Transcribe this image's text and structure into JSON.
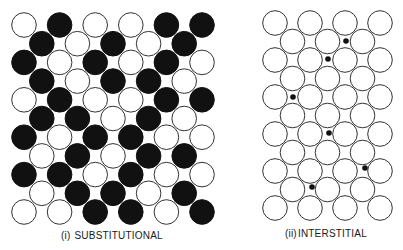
{
  "figure": {
    "colors": {
      "background": "#ffffff",
      "host_atom_fill": "#ffffff",
      "solute_atom_fill": "#111111",
      "outline": "#333333",
      "interstitial_fill": "#111111"
    },
    "panels": [
      {
        "id": "substitutional",
        "numeral": "(i)",
        "caption": "SUBSTITUTIONAL",
        "atom_radius": 12.3,
        "origin_x": 24,
        "origin_y": 25,
        "col_spacing": 35.6,
        "row_spacing": 18.7,
        "rows": [
          [
            0,
            1,
            0,
            0,
            1,
            1
          ],
          [
            1,
            0,
            1,
            0,
            1
          ],
          [
            1,
            0,
            1,
            0,
            1,
            0
          ],
          [
            1,
            0,
            1,
            1,
            0
          ],
          [
            0,
            1,
            0,
            0,
            1,
            1
          ],
          [
            1,
            1,
            0,
            1,
            0
          ],
          [
            1,
            0,
            1,
            1,
            0,
            0
          ],
          [
            0,
            1,
            0,
            1,
            1
          ],
          [
            1,
            1,
            0,
            1,
            0,
            0
          ],
          [
            0,
            1,
            1,
            0,
            1
          ],
          [
            0,
            0,
            1,
            1,
            0,
            1
          ]
        ],
        "legend": {
          "0": "host atom (white)",
          "1": "substitutional solute atom (black)"
        }
      },
      {
        "id": "interstitial",
        "numeral": "(ii)",
        "caption": "INTERSTITIAL",
        "atom_radius": 12.3,
        "origin_x": 275,
        "origin_y": 23,
        "col_spacing": 35,
        "row_spacing": 18.5,
        "rows": [
          [
            0,
            0,
            0,
            0
          ],
          [
            0,
            0,
            0
          ],
          [
            0,
            0,
            0,
            0
          ],
          [
            0,
            0,
            0
          ],
          [
            0,
            0,
            0,
            0
          ],
          [
            0,
            0,
            0
          ],
          [
            0,
            0,
            0,
            0
          ],
          [
            0,
            0,
            0
          ],
          [
            0,
            0,
            0,
            0
          ],
          [
            0,
            0,
            0
          ],
          [
            0,
            0,
            0,
            0
          ]
        ],
        "interstitial_radius": 2.8,
        "interstitials": [
          {
            "x": 346,
            "y": 41
          },
          {
            "x": 328,
            "y": 59
          },
          {
            "x": 293,
            "y": 97
          },
          {
            "x": 329,
            "y": 133
          },
          {
            "x": 365,
            "y": 168
          },
          {
            "x": 312,
            "y": 187
          }
        ]
      }
    ]
  }
}
